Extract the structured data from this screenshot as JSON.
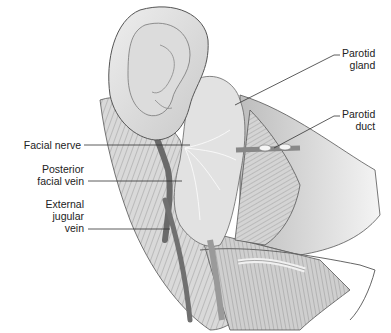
{
  "figure": {
    "labels": {
      "parotid_gland": [
        "Parotid",
        "gland"
      ],
      "parotid_duct": [
        "Parotid",
        "duct"
      ],
      "facial_nerve": [
        "Facial nerve"
      ],
      "posterior_facial_vein": [
        "Posterior",
        "facial vein"
      ],
      "external_jugular_vein": [
        "External",
        "jugular",
        "vein"
      ]
    },
    "colors": {
      "line": "#333333",
      "text": "#222222",
      "vein": "#6a6a6a",
      "skin": "#d8d8d8",
      "muscle": "#bdbdbd"
    }
  }
}
